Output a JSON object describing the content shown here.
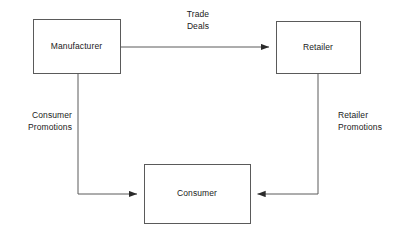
{
  "diagram": {
    "type": "flow-diagram",
    "background_color": "#ffffff",
    "line_color": "#5a5a5a",
    "text_color": "#1a1a1a",
    "nodes": [
      {
        "id": "manufacturer",
        "label": "Manufacturer",
        "x": 33,
        "y": 19,
        "w": 87,
        "h": 54
      },
      {
        "id": "retailer",
        "label": "Retailer",
        "x": 276,
        "y": 21,
        "w": 84,
        "h": 52
      },
      {
        "id": "consumer",
        "label": "Consumer",
        "x": 144,
        "y": 164,
        "w": 106,
        "h": 59
      }
    ],
    "edges": [
      {
        "id": "trade-deals",
        "from": "manufacturer",
        "to": "retailer",
        "label_line1": "Trade",
        "label_line2": "Deals",
        "label_align": "center"
      },
      {
        "id": "consumer-promotions",
        "from": "manufacturer",
        "to": "consumer",
        "label_line1": "Consumer",
        "label_line2": "Promotions",
        "label_align": "right"
      },
      {
        "id": "retailer-promotions",
        "from": "retailer",
        "to": "consumer",
        "label_line1": "Retailer",
        "label_line2": "Promotions",
        "label_align": "left"
      }
    ]
  }
}
